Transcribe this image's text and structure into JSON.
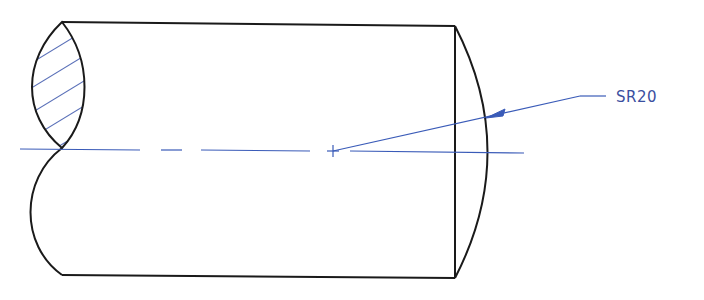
{
  "drawing": {
    "title": "Cylinder with spherical end - broken section view",
    "dimension_label": "SR20",
    "colors": {
      "outline": "#1a1a1a",
      "annotation": "#3a5bb8",
      "hatch": "#5a70b8"
    }
  }
}
